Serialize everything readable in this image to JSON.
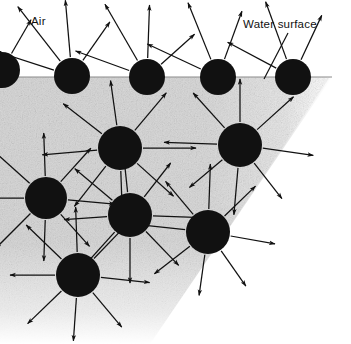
{
  "figure": {
    "title_labels": {
      "air": "Air",
      "water_surface": "Water surface"
    },
    "colors": {
      "molecule": "#111111",
      "water_body": "#d6d6d6",
      "air_background": "#ffffff",
      "arrow": "#111111",
      "text": "#111111"
    },
    "geometry": {
      "width": 351,
      "height": 344,
      "surface_y": 77,
      "molecule_radius": 18,
      "water_right_edge_top_x": 330,
      "water_right_edge_bottom_x": 150
    },
    "leader_line": {
      "name": "water-surface-leader",
      "x1": 288,
      "y1": 33,
      "x2": 264,
      "y2": 79
    },
    "molecules": [
      {
        "id": "edge-left-surface",
        "cx": 2,
        "cy": 70,
        "r": 18,
        "surface": true,
        "arrows": [
          [
            215,
            52
          ],
          [
            255,
            44
          ],
          [
            300,
            40
          ]
        ]
      },
      {
        "id": "surface-1",
        "cx": 72,
        "cy": 76,
        "r": 18,
        "surface": true,
        "arrows": [
          [
            198,
            62
          ],
          [
            232,
            70
          ],
          [
            265,
            58
          ],
          [
            305,
            48
          ]
        ]
      },
      {
        "id": "surface-2",
        "cx": 147,
        "cy": 77,
        "r": 18,
        "surface": true,
        "arrows": [
          [
            200,
            58
          ],
          [
            240,
            66
          ],
          [
            272,
            54
          ],
          [
            318,
            46
          ]
        ]
      },
      {
        "id": "surface-3",
        "cx": 218,
        "cy": 77,
        "r": 18,
        "surface": true,
        "arrows": [
          [
            205,
            60
          ],
          [
            248,
            62
          ],
          [
            290,
            52
          ]
        ]
      },
      {
        "id": "surface-4",
        "cx": 293,
        "cy": 77,
        "r": 18,
        "surface": true,
        "arrows": [
          [
            208,
            56
          ],
          [
            250,
            62
          ],
          [
            295,
            50
          ]
        ]
      },
      {
        "id": "interior-1",
        "cx": 120,
        "cy": 148,
        "r": 22,
        "surface": false,
        "arrows": [
          [
            0,
            54
          ],
          [
            42,
            50
          ],
          [
            88,
            44
          ],
          [
            128,
            52
          ],
          [
            175,
            56
          ],
          [
            218,
            50
          ],
          [
            262,
            46
          ],
          [
            310,
            50
          ]
        ]
      },
      {
        "id": "interior-2",
        "cx": 240,
        "cy": 145,
        "r": 22,
        "surface": false,
        "arrows": [
          [
            8,
            52
          ],
          [
            52,
            46
          ],
          [
            95,
            48
          ],
          [
            140,
            44
          ],
          [
            182,
            54
          ],
          [
            228,
            48
          ],
          [
            270,
            44
          ],
          [
            318,
            50
          ]
        ]
      },
      {
        "id": "interior-3",
        "cx": 46,
        "cy": 198,
        "r": 21,
        "surface": false,
        "arrows": [
          [
            5,
            48
          ],
          [
            48,
            44
          ],
          [
            92,
            42
          ],
          [
            135,
            50
          ],
          [
            180,
            46
          ],
          [
            222,
            48
          ],
          [
            268,
            44
          ],
          [
            312,
            46
          ]
        ]
      },
      {
        "id": "interior-4",
        "cx": 130,
        "cy": 215,
        "r": 22,
        "surface": false,
        "arrows": [
          [
            2,
            50
          ],
          [
            46,
            48
          ],
          [
            90,
            46
          ],
          [
            132,
            52
          ],
          [
            176,
            44
          ],
          [
            220,
            50
          ],
          [
            264,
            48
          ],
          [
            308,
            44
          ]
        ]
      },
      {
        "id": "interior-5",
        "cx": 208,
        "cy": 232,
        "r": 22,
        "surface": false,
        "arrows": [
          [
            10,
            46
          ],
          [
            55,
            44
          ],
          [
            98,
            42
          ],
          [
            142,
            46
          ],
          [
            186,
            48
          ],
          [
            230,
            44
          ],
          [
            272,
            46
          ],
          [
            316,
            44
          ]
        ]
      },
      {
        "id": "interior-6",
        "cx": 78,
        "cy": 275,
        "r": 22,
        "surface": false,
        "arrows": [
          [
            6,
            50
          ],
          [
            50,
            46
          ],
          [
            94,
            44
          ],
          [
            136,
            48
          ],
          [
            180,
            46
          ],
          [
            224,
            50
          ],
          [
            268,
            46
          ],
          [
            314,
            48
          ]
        ]
      }
    ]
  }
}
